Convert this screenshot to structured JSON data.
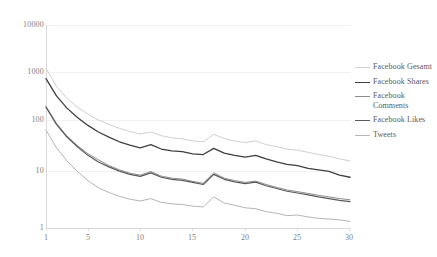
{
  "chart_data": {
    "type": "line",
    "title": "",
    "subtitle": "",
    "xlabel": "",
    "ylabel": "",
    "yscale": "log",
    "ylim": [
      1,
      10000
    ],
    "xlim": [
      1,
      30
    ],
    "grid": true,
    "legend_position": "right",
    "y_ticks": [
      "1",
      "10",
      "100",
      "1000",
      "10000"
    ],
    "y_tick_values": [
      1,
      10,
      100,
      1000,
      10000
    ],
    "x_ticks": [
      "1",
      "5",
      "10",
      "15",
      "20",
      "25",
      "30"
    ],
    "x_tick_values": [
      1,
      5,
      10,
      15,
      20,
      25,
      30
    ],
    "x": [
      1,
      2,
      3,
      4,
      5,
      6,
      7,
      8,
      9,
      10,
      11,
      12,
      13,
      14,
      15,
      16,
      17,
      18,
      19,
      20,
      21,
      22,
      23,
      24,
      25,
      26,
      27,
      28,
      29,
      30
    ],
    "series": [
      {
        "name": "Facebook Gesamt",
        "color": "#d0d0d0",
        "width": 1.0,
        "values": [
          1400,
          620,
          360,
          240,
          175,
          135,
          110,
          92,
          80,
          71,
          78,
          66,
          60,
          57,
          52,
          50,
          70,
          58,
          52,
          48,
          52,
          44,
          40,
          36,
          34,
          31,
          28,
          26,
          23,
          21
        ]
      },
      {
        "name": "Facebook Shares",
        "color": "#3f3f3f",
        "width": 1.3,
        "values": [
          880,
          400,
          230,
          150,
          105,
          78,
          62,
          50,
          43,
          38,
          44,
          36,
          33,
          32,
          29,
          28,
          37,
          30,
          27,
          25,
          27,
          23,
          20,
          18,
          17,
          15,
          14,
          13,
          11,
          10
        ]
      },
      {
        "name": "Facebook Comments",
        "color": "#8c8c8c",
        "width": 1.0,
        "values": [
          250,
          115,
          65,
          42,
          29,
          22,
          17,
          14,
          12,
          11,
          13,
          10.5,
          9.6,
          9.2,
          8.3,
          7.6,
          12.2,
          9.6,
          8.6,
          7.9,
          8.4,
          7.2,
          6.3,
          5.6,
          5.2,
          4.8,
          4.4,
          4.1,
          3.8,
          3.6
        ]
      },
      {
        "name": "Facebook Likes",
        "color": "#5a5a5a",
        "width": 1.2,
        "values": [
          240,
          110,
          62,
          40,
          27,
          20,
          16,
          13.2,
          11.4,
          10.4,
          12.2,
          10,
          9.1,
          8.7,
          7.9,
          7.2,
          11.4,
          9.1,
          8.1,
          7.5,
          8,
          6.8,
          6,
          5.3,
          4.9,
          4.5,
          4.1,
          3.8,
          3.5,
          3.3
        ]
      },
      {
        "name": "Tweets",
        "color": "#b5b5b5",
        "width": 1.0,
        "values": [
          85,
          38,
          21,
          13,
          8.6,
          6.2,
          5,
          4.2,
          3.7,
          3.4,
          3.8,
          3.2,
          3,
          2.9,
          2.7,
          2.6,
          4.1,
          3.1,
          2.8,
          2.5,
          2.4,
          2.1,
          1.95,
          1.75,
          1.8,
          1.65,
          1.55,
          1.5,
          1.45,
          1.35
        ]
      }
    ]
  }
}
